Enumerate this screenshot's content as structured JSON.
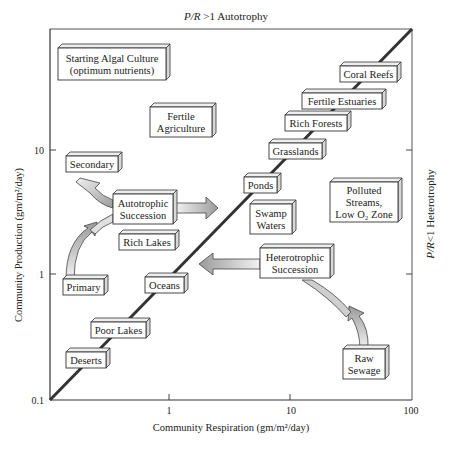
{
  "chart_data": {
    "type": "diagram",
    "title_top": "P/R > 1 Autotrophy",
    "title_top_parts": [
      "P/R",
      " >1 Autotrophy"
    ],
    "title_right": "P/R < 1 Heterotrophy",
    "title_right_parts": [
      "P/R",
      "<1 Heterotrophy"
    ],
    "xlabel": "Community Respiration (gm/m²/day)",
    "ylabel": "Community Production (gm/m²/day)",
    "xscale": "log",
    "yscale": "log",
    "xlim": [
      0.1,
      100
    ],
    "ylim": [
      0.1,
      100
    ],
    "x_ticks": [
      "1",
      "10",
      "100"
    ],
    "y_ticks": [
      "0.1",
      "1",
      "10"
    ],
    "diagonal": "P = R line (P/R = 1)",
    "boxes": [
      {
        "id": "starting-algal-culture",
        "lines": [
          "Starting Algal Culture",
          "(optimum nutrients)"
        ],
        "x": 58,
        "y": 48,
        "w": 108,
        "h": 32
      },
      {
        "id": "fertile-agriculture",
        "lines": [
          "Fertile",
          "Agriculture"
        ],
        "x": 150,
        "y": 107,
        "w": 62,
        "h": 30
      },
      {
        "id": "coral-reefs",
        "lines": [
          "Coral Reefs"
        ],
        "x": 340,
        "y": 66,
        "w": 57,
        "h": 16
      },
      {
        "id": "fertile-estuaries",
        "lines": [
          "Fertile Estuaries"
        ],
        "x": 302,
        "y": 93,
        "w": 80,
        "h": 16
      },
      {
        "id": "rich-forests",
        "lines": [
          "Rich Forests"
        ],
        "x": 285,
        "y": 115,
        "w": 62,
        "h": 16
      },
      {
        "id": "grasslands",
        "lines": [
          "Grasslands"
        ],
        "x": 269,
        "y": 143,
        "w": 53,
        "h": 16
      },
      {
        "id": "ponds",
        "lines": [
          "Ponds"
        ],
        "x": 244,
        "y": 177,
        "w": 33,
        "h": 16
      },
      {
        "id": "swamp-waters",
        "lines": [
          "Swamp",
          "Waters"
        ],
        "x": 250,
        "y": 204,
        "w": 42,
        "h": 30
      },
      {
        "id": "polluted-streams",
        "lines": [
          "Polluted",
          "Streams,",
          "Low O₂ Zone"
        ],
        "x": 330,
        "y": 182,
        "w": 68,
        "h": 40
      },
      {
        "id": "secondary",
        "lines": [
          "Secondary"
        ],
        "x": 66,
        "y": 156,
        "w": 52,
        "h": 16
      },
      {
        "id": "autotrophic-succession",
        "lines": [
          "Autotrophic",
          "Succession"
        ],
        "x": 113,
        "y": 194,
        "w": 60,
        "h": 30
      },
      {
        "id": "rich-lakes",
        "lines": [
          "Rich Lakes"
        ],
        "x": 119,
        "y": 234,
        "w": 56,
        "h": 16
      },
      {
        "id": "heterotrophic-succession",
        "lines": [
          "Heterotrophic",
          "Succession"
        ],
        "x": 260,
        "y": 248,
        "w": 70,
        "h": 30
      },
      {
        "id": "primary",
        "lines": [
          "Primary"
        ],
        "x": 63,
        "y": 279,
        "w": 41,
        "h": 16
      },
      {
        "id": "oceans",
        "lines": [
          "Oceans"
        ],
        "x": 145,
        "y": 277,
        "w": 39,
        "h": 16
      },
      {
        "id": "poor-lakes",
        "lines": [
          "Poor Lakes"
        ],
        "x": 91,
        "y": 322,
        "w": 55,
        "h": 16
      },
      {
        "id": "deserts",
        "lines": [
          "Deserts"
        ],
        "x": 66,
        "y": 352,
        "w": 40,
        "h": 16
      },
      {
        "id": "raw-sewage",
        "lines": [
          "Raw",
          "Sewage"
        ],
        "x": 343,
        "y": 349,
        "w": 42,
        "h": 30
      }
    ],
    "arrows": [
      {
        "id": "secondary-to-autotrophic",
        "from": "Secondary",
        "to": "Autotrophic Succession"
      },
      {
        "id": "primary-to-autotrophic",
        "from": "Primary",
        "to": "Autotrophic Succession"
      },
      {
        "id": "autotrophic-to-right",
        "from": "Autotrophic Succession",
        "to": "toward P/R=1 line (right)"
      },
      {
        "id": "heterotrophic-to-left",
        "from": "Heterotrophic Succession",
        "to": "toward P/R=1 line (left)"
      },
      {
        "id": "sewage-to-heterotrophic",
        "from": "Raw Sewage",
        "to": "Heterotrophic Succession"
      }
    ]
  },
  "colors": {
    "ink": "#222222",
    "box_fill": "#ffffff",
    "box_side": "#d8d8d8",
    "arrow_light": "#f0f0f0",
    "arrow_dark": "#9a9a9a"
  }
}
